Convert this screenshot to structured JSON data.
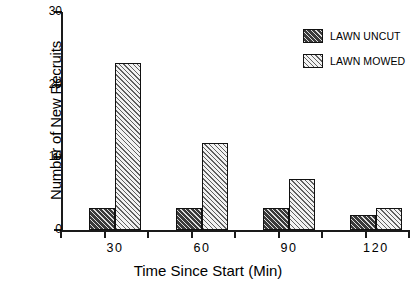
{
  "chart_data": {
    "type": "bar",
    "title": "",
    "subtitle": "",
    "xlabel": "Time Since Start (Min)",
    "ylabel": "Number of New Recruits",
    "categories": [
      "30",
      "60",
      "90",
      "120"
    ],
    "series": [
      {
        "name": "LAWN UNCUT",
        "values": [
          3,
          3,
          3,
          2
        ],
        "fill": "dark-hatch",
        "color": "#3a3a3a"
      },
      {
        "name": "LAWN MOWED",
        "values": [
          23,
          12,
          7,
          3
        ],
        "fill": "light-hatch",
        "color": "#f2f2f2"
      }
    ],
    "ylim": [
      0,
      30
    ],
    "yticks": [
      0,
      10,
      20,
      30
    ],
    "ytick_labels": [
      "0",
      "10",
      "20",
      "30"
    ],
    "xtick_labels": [
      "30",
      "60",
      "90",
      "120"
    ],
    "grid": false,
    "legend_position": "top-right",
    "annotations": []
  },
  "legend": {
    "entries": [
      {
        "label": "LAWN UNCUT"
      },
      {
        "label": "LAWN MOWED"
      }
    ]
  },
  "axes": {
    "y_title": "Number of New Recruits",
    "x_title": "Time Since Start (Min)"
  }
}
